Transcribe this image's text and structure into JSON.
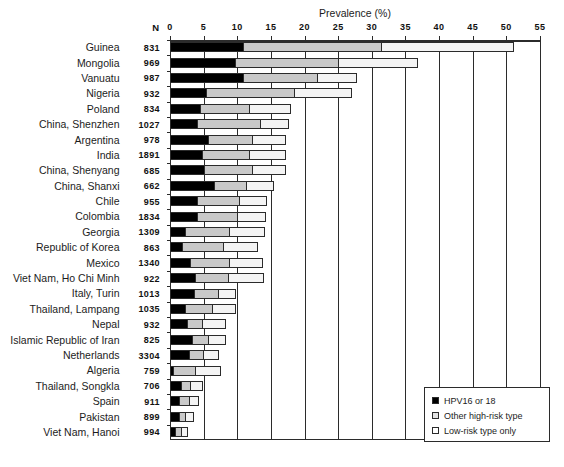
{
  "chart_data": {
    "type": "bar",
    "orientation": "horizontal",
    "stacked": true,
    "title": "",
    "xlabel": "Prevalence (%)",
    "ylabel": "",
    "xlim": [
      0,
      55
    ],
    "xticks": [
      0,
      5,
      10,
      15,
      20,
      25,
      30,
      35,
      40,
      45,
      50,
      55
    ],
    "xtick_labels": [
      "0",
      "5",
      "10",
      "15",
      "20",
      "25",
      "30",
      "35",
      "40",
      "45",
      "50",
      "55"
    ],
    "grid": true,
    "legend_position": "bottom-right",
    "n_column_header": "N",
    "categories": [
      "Guinea",
      "Mongolia",
      "Vanuatu",
      "Nigeria",
      "Poland",
      "China, Shenzhen",
      "Argentina",
      "India",
      "China, Shenyang",
      "China, Shanxi",
      "Chile",
      "Colombia",
      "Georgia",
      "Republic of Korea",
      "Mexico",
      "Viet Nam, Ho Chi Minh",
      "Italy, Turin",
      "Thailand, Lampang",
      "Nepal",
      "Islamic Republic of Iran",
      "Netherlands",
      "Algeria",
      "Thailand, Songkla",
      "Spain",
      "Pakistan",
      "Viet Nam, Hanoi"
    ],
    "n_values": [
      831,
      969,
      987,
      932,
      834,
      1027,
      978,
      1891,
      685,
      662,
      955,
      1834,
      1309,
      863,
      1340,
      922,
      1013,
      1035,
      932,
      825,
      3304,
      759,
      706,
      911,
      899,
      994
    ],
    "series": [
      {
        "name": "HPV16 or 18",
        "color": "#000000",
        "values": [
          10.9,
          9.6,
          10.9,
          5.4,
          4.4,
          4.0,
          5.7,
          4.7,
          5.0,
          6.5,
          4.0,
          4.0,
          2.2,
          1.8,
          2.9,
          3.7,
          3.5,
          2.2,
          2.5,
          3.2,
          2.8,
          0.4,
          1.6,
          1.3,
          1.3,
          0.7
        ]
      },
      {
        "name": "Other high-risk type",
        "color": "#c9c9c9",
        "values": [
          20.4,
          15.4,
          10.9,
          13.1,
          7.4,
          9.4,
          6.5,
          7.1,
          7.2,
          4.8,
          6.3,
          6.0,
          6.5,
          6.1,
          5.8,
          4.9,
          3.7,
          4.0,
          2.3,
          2.5,
          2.1,
          3.3,
          1.4,
          1.5,
          0.9,
          0.9
        ]
      },
      {
        "name": "Low-risk type only",
        "color": "#f4f4f4",
        "values": [
          19.7,
          11.7,
          5.8,
          8.4,
          6.1,
          4.2,
          4.9,
          5.3,
          4.9,
          4.0,
          4.0,
          4.1,
          5.3,
          5.0,
          5.0,
          5.3,
          2.5,
          3.5,
          3.4,
          2.5,
          2.3,
          3.8,
          1.7,
          1.4,
          1.2,
          0.9
        ]
      }
    ]
  },
  "legend": {
    "items": [
      {
        "label": "HPV16 or 18",
        "swatch": "sw-hpv"
      },
      {
        "label": "Other high-risk type",
        "swatch": "sw-hr"
      },
      {
        "label": "Low-risk type only",
        "swatch": "sw-lr"
      }
    ]
  }
}
